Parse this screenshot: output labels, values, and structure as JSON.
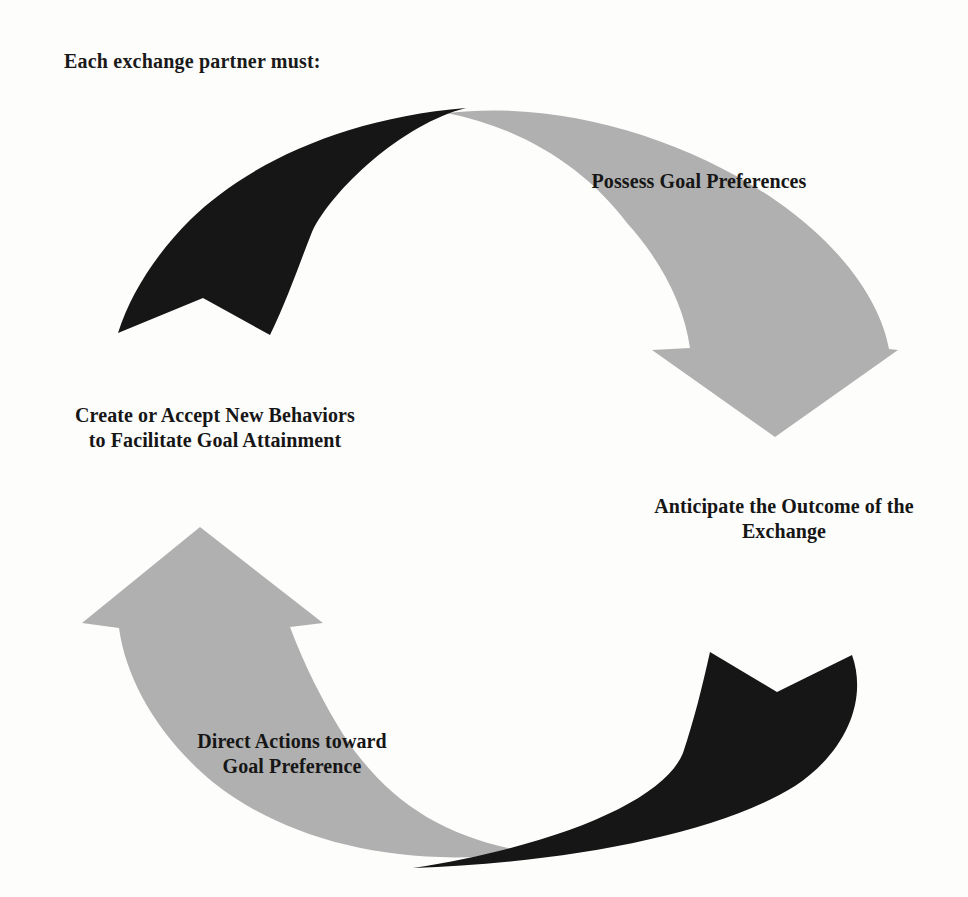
{
  "heading": "Each exchange partner must:",
  "colors": {
    "background": "#fdfdfc",
    "arrow_gray": "#b0b0b0",
    "arrow_dark": "#161616",
    "text": "#1a1a1a"
  },
  "steps": [
    {
      "id": "possess-goal-preferences",
      "position": "top-right",
      "lines": [
        "Possess Goal Preferences"
      ]
    },
    {
      "id": "anticipate-outcome-of-exchange",
      "position": "right",
      "lines": [
        "Anticipate the Outcome of the",
        "Exchange"
      ]
    },
    {
      "id": "direct-actions-toward-goal",
      "position": "bottom-left",
      "lines": [
        "Direct Actions toward",
        "Goal Preference"
      ]
    },
    {
      "id": "create-or-accept-new-behaviors",
      "position": "left",
      "lines": [
        "Create or Accept New Behaviors",
        "to Facilitate Goal Attainment"
      ]
    }
  ],
  "arrows": [
    {
      "id": "gray-arrow-top-right",
      "fill": "#b0b0b0",
      "from": "top-center",
      "to": "right-middle",
      "head": "triangle-down"
    },
    {
      "id": "gray-arrow-bottom-left",
      "fill": "#b0b0b0",
      "from": "bottom-center",
      "to": "left-middle",
      "head": "triangle-up"
    },
    {
      "id": "dark-arrow-top-left",
      "fill": "#161616",
      "from": "top-center",
      "to": "upper-left",
      "head": "barbed-chevron"
    },
    {
      "id": "dark-arrow-bottom-right",
      "fill": "#161616",
      "from": "bottom-center",
      "to": "lower-right",
      "head": "barbed-chevron"
    }
  ]
}
